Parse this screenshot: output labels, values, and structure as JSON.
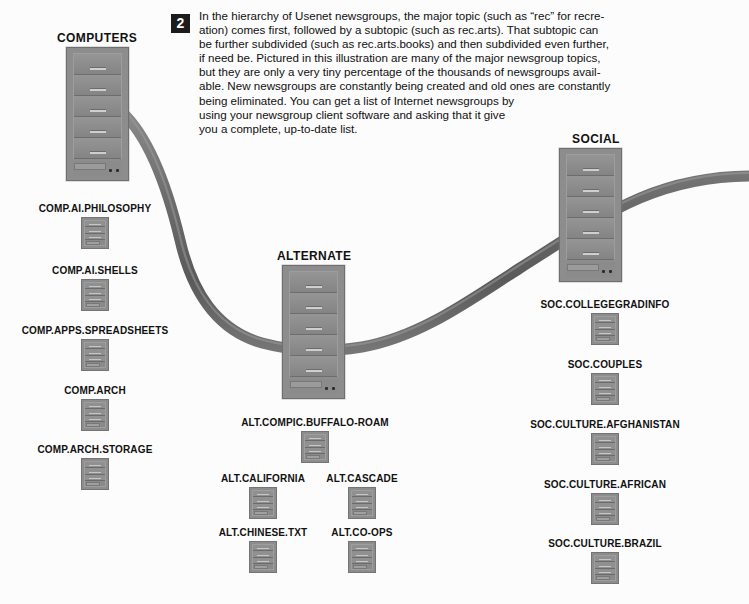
{
  "callout": {
    "number": "2",
    "lines": [
      "In the hierarchy of Usenet newsgroups, the major topic (such as “rec” for recre-",
      "ation) comes first, followed by a subtopic (such as rec.arts). That subtopic can",
      "be further subdivided (such as rec.arts.books) and then subdivided even further,",
      "if need be. Pictured in this illustration are many of the major newsgroup topics,",
      "but they are only a very tiny percentage of the thousands of newsgroups avail-",
      "able. New newsgroups are constantly being created and old ones are constantly",
      "being eliminated. You can get a list of Internet newsgroups by",
      "using your newsgroup client software and asking that it give",
      "you a complete, up-to-date list."
    ]
  },
  "towers": [
    {
      "id": "computers",
      "caption": "COMPUTERS",
      "bays": 5
    },
    {
      "id": "alternate",
      "caption": "ALTERNATE",
      "bays": 5
    },
    {
      "id": "social",
      "caption": "SOCIAL",
      "bays": 5
    }
  ],
  "groups": {
    "computers": [
      "COMP.AI.PHILOSOPHY",
      "COMP.AI.SHELLS",
      "COMP.APPS.SPREADSHEETS",
      "COMP.ARCH",
      "COMP.ARCH.STORAGE"
    ],
    "alternate": [
      "ALT.COMPIC.BUFFALO-ROAM",
      "ALT.CALIFORNIA",
      "ALT.CASCADE",
      "ALT.CHINESE.TXT",
      "ALT.CO-OPS"
    ],
    "social": [
      "SOC.COLLEGEGRADINFO",
      "SOC.COUPLES",
      "SOC.CULTURE.AFGHANISTAN",
      "SOC.CULTURE.AFRICAN",
      "SOC.CULTURE.BRAZIL"
    ]
  },
  "colors": {
    "background": "#fcfcfc",
    "tower_body": "#8d8d8d",
    "tower_edge": "#6f6f6f",
    "cable": "#6b6b6b",
    "text": "#111111",
    "badge_bg": "#1c1c1c",
    "badge_fg": "#ffffff"
  }
}
